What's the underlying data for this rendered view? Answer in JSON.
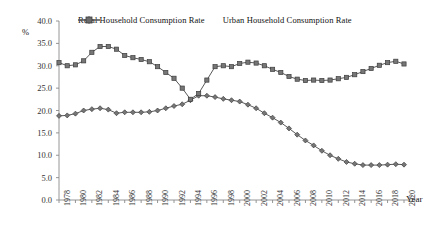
{
  "chart_data": {
    "type": "line",
    "title": "",
    "xlabel": "Year",
    "ylabel": "%",
    "ylim": [
      0.0,
      40.0
    ],
    "ytick_step": 5.0,
    "yticks": [
      "0.0",
      "5.0",
      "10.0",
      "15.0",
      "20.0",
      "25.0",
      "30.0",
      "35.0",
      "40.0"
    ],
    "grid": false,
    "legend_position": "top",
    "xtick_step_years": 2,
    "xticks": [
      "1978",
      "1980",
      "1982",
      "1984",
      "1986",
      "1988",
      "1990",
      "1992",
      "1994",
      "1996",
      "1998",
      "2000",
      "2002",
      "2004",
      "2006",
      "2008",
      "2010",
      "2012",
      "2014",
      "2016",
      "2018",
      "2020"
    ],
    "x": [
      1978,
      1979,
      1980,
      1981,
      1982,
      1983,
      1984,
      1985,
      1986,
      1987,
      1988,
      1989,
      1990,
      1991,
      1992,
      1993,
      1994,
      1995,
      1996,
      1997,
      1998,
      1999,
      2000,
      2001,
      2002,
      2003,
      2004,
      2005,
      2006,
      2007,
      2008,
      2009,
      2010,
      2011,
      2012,
      2013,
      2014,
      2015,
      2016,
      2017,
      2018,
      2019,
      2020
    ],
    "series": [
      {
        "name": "Rural Household Consumption Rate",
        "color": "#595959",
        "marker": "diamond",
        "values": [
          18.8,
          18.9,
          19.3,
          20.0,
          20.3,
          20.5,
          20.2,
          19.4,
          19.6,
          19.6,
          19.6,
          19.7,
          20.0,
          20.5,
          21.0,
          21.4,
          22.3,
          23.3,
          23.3,
          23.0,
          22.6,
          22.3,
          22.0,
          21.3,
          20.5,
          19.4,
          18.4,
          17.3,
          16.0,
          14.6,
          13.3,
          12.2,
          11.0,
          10.0,
          9.2,
          8.5,
          8.1,
          7.8,
          7.8,
          7.8,
          7.9,
          8.0,
          7.9
        ]
      },
      {
        "name": "Urban Household Consumption Rate",
        "color": "#595959",
        "marker": "square",
        "values": [
          30.7,
          30.0,
          30.2,
          31.1,
          33.0,
          34.3,
          34.3,
          33.7,
          32.3,
          31.8,
          31.4,
          30.9,
          29.8,
          28.5,
          27.2,
          25.0,
          22.5,
          23.8,
          26.8,
          29.8,
          30.0,
          29.8,
          30.5,
          30.8,
          30.6,
          30.0,
          29.2,
          28.5,
          27.6,
          27.0,
          26.7,
          26.8,
          26.7,
          26.8,
          27.1,
          27.4,
          28.0,
          28.7,
          29.4,
          30.1,
          30.7,
          31.0,
          30.4
        ]
      }
    ]
  },
  "legend": {
    "entries": [
      {
        "label": "Rural Household Consumption Rate"
      },
      {
        "label": "Urban Household Consumption Rate"
      }
    ]
  },
  "axes": {
    "y_unit_label": "%",
    "x_title": "Year"
  }
}
